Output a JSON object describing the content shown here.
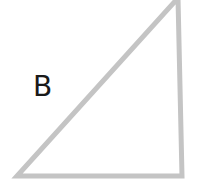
{
  "diagram": {
    "shape": "right-triangle",
    "stroke_color": "#c4c4c4",
    "fill_color": "#ffffff",
    "vertices": {
      "top": [
        178,
        0
      ],
      "bottom_right": [
        182,
        176
      ],
      "bottom_left": [
        17,
        176
      ]
    },
    "label": {
      "text": "B",
      "color": "#1a1a1a"
    }
  }
}
